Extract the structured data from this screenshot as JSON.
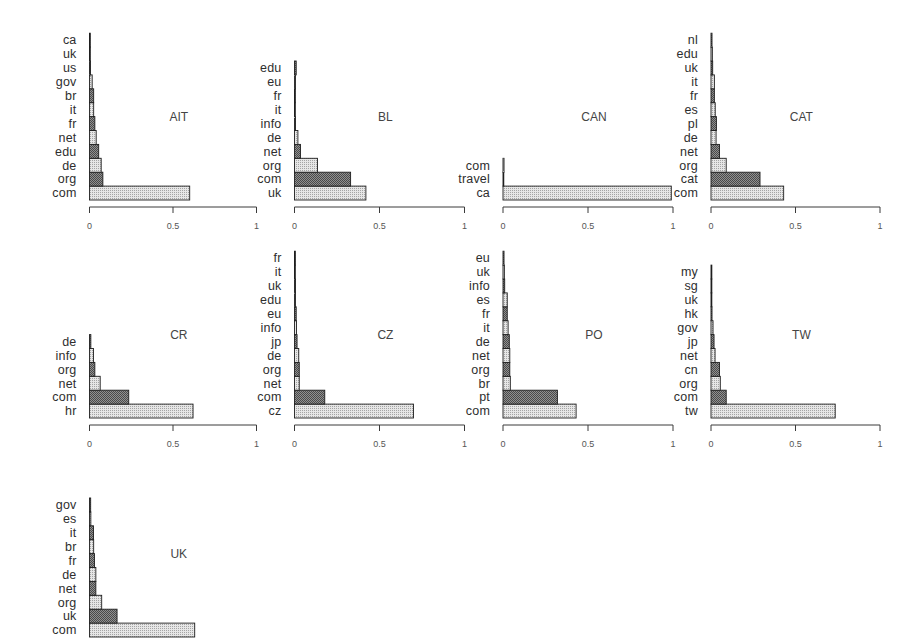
{
  "style": {
    "background": "#ffffff",
    "light_bar_fill": "#e6e6e6",
    "light_bar_dots": "#a4a4a4",
    "dark_bar_fill": "#909090",
    "dark_bar_dots": "#4a4a4a",
    "bar_border": "#1e1e1e",
    "axis_color": "#3a3a3a",
    "note": "bars alternate light/dark starting with light at the bottom"
  },
  "chart_data": [
    {
      "type": "bar",
      "orientation": "horizontal",
      "title": "AIT",
      "categories": [
        "com",
        "org",
        "de",
        "edu",
        "net",
        "fr",
        "it",
        "br",
        "gov",
        "us",
        "uk",
        "ca"
      ],
      "values": [
        0.6,
        0.08,
        0.07,
        0.055,
        0.04,
        0.032,
        0.025,
        0.025,
        0.016,
        0.006,
        0.005,
        0.004
      ],
      "xlim": [
        0,
        1
      ],
      "xticks": [
        0,
        0.5,
        1
      ],
      "xtick_labels": [
        "0",
        "0.5",
        "1"
      ]
    },
    {
      "type": "bar",
      "orientation": "horizontal",
      "title": "BL",
      "categories": [
        "uk",
        "com",
        "org",
        "net",
        "de",
        "info",
        "it",
        "fr",
        "eu",
        "edu"
      ],
      "values": [
        0.42,
        0.33,
        0.135,
        0.035,
        0.02,
        0.006,
        0.005,
        0.005,
        0.006,
        0.01
      ],
      "xlim": [
        0,
        1
      ],
      "xticks": [
        0,
        0.5,
        1
      ],
      "xtick_labels": [
        "0",
        "0.5",
        "1"
      ]
    },
    {
      "type": "bar",
      "orientation": "horizontal",
      "title": "CAN",
      "categories": [
        "ca",
        "travel",
        "com"
      ],
      "values": [
        0.99,
        0.004,
        0.006
      ],
      "xlim": [
        0,
        1
      ],
      "xticks": [
        0,
        0.5,
        1
      ],
      "xtick_labels": [
        "0",
        "0.5",
        "1"
      ]
    },
    {
      "type": "bar",
      "orientation": "horizontal",
      "title": "CAT",
      "categories": [
        "com",
        "cat",
        "org",
        "net",
        "de",
        "pl",
        "es",
        "fr",
        "it",
        "uk",
        "edu",
        "nl"
      ],
      "values": [
        0.43,
        0.29,
        0.09,
        0.05,
        0.03,
        0.032,
        0.025,
        0.02,
        0.02,
        0.01,
        0.008,
        0.006
      ],
      "xlim": [
        0,
        1
      ],
      "xticks": [
        0,
        0.5,
        1
      ],
      "xtick_labels": [
        "0",
        "0.5",
        "1"
      ]
    },
    {
      "type": "bar",
      "orientation": "horizontal",
      "title": "CR",
      "categories": [
        "hr",
        "com",
        "net",
        "org",
        "info",
        "de"
      ],
      "values": [
        0.62,
        0.235,
        0.064,
        0.032,
        0.024,
        0.008
      ],
      "xlim": [
        0,
        1
      ],
      "xticks": [
        0,
        0.5,
        1
      ],
      "xtick_labels": [
        "0",
        "0.5",
        "1"
      ]
    },
    {
      "type": "bar",
      "orientation": "horizontal",
      "title": "CZ",
      "categories": [
        "cz",
        "com",
        "net",
        "org",
        "de",
        "jp",
        "info",
        "eu",
        "edu",
        "uk",
        "it",
        "fr"
      ],
      "values": [
        0.7,
        0.178,
        0.028,
        0.028,
        0.025,
        0.015,
        0.012,
        0.01,
        0.006,
        0.006,
        0.005,
        0.005
      ],
      "xlim": [
        0,
        1
      ],
      "xticks": [
        0,
        0.5,
        1
      ],
      "xtick_labels": [
        "0",
        "0.5",
        "1"
      ]
    },
    {
      "type": "bar",
      "orientation": "horizontal",
      "title": "PO",
      "categories": [
        "com",
        "pt",
        "br",
        "org",
        "net",
        "de",
        "it",
        "fr",
        "es",
        "info",
        "uk",
        "eu"
      ],
      "values": [
        0.43,
        0.32,
        0.043,
        0.04,
        0.04,
        0.037,
        0.03,
        0.025,
        0.025,
        0.01,
        0.008,
        0.006
      ],
      "xlim": [
        0,
        1
      ],
      "xticks": [
        0,
        0.5,
        1
      ],
      "xtick_labels": [
        "0",
        "0.5",
        "1"
      ]
    },
    {
      "type": "bar",
      "orientation": "horizontal",
      "title": "TW",
      "categories": [
        "tw",
        "com",
        "org",
        "cn",
        "net",
        "jp",
        "gov",
        "hk",
        "uk",
        "sg",
        "my"
      ],
      "values": [
        0.735,
        0.09,
        0.055,
        0.05,
        0.024,
        0.018,
        0.012,
        0.006,
        0.005,
        0.005,
        0.005
      ],
      "xlim": [
        0,
        1
      ],
      "xticks": [
        0,
        0.5,
        1
      ],
      "xtick_labels": [
        "0",
        "0.5",
        "1"
      ]
    },
    {
      "type": "bar",
      "orientation": "horizontal",
      "title": "UK",
      "categories": [
        "com",
        "uk",
        "org",
        "net",
        "de",
        "fr",
        "br",
        "it",
        "es",
        "gov"
      ],
      "values": [
        0.63,
        0.165,
        0.073,
        0.038,
        0.038,
        0.03,
        0.025,
        0.024,
        0.008,
        0.007
      ],
      "xlim": [
        0,
        1
      ]
    }
  ]
}
